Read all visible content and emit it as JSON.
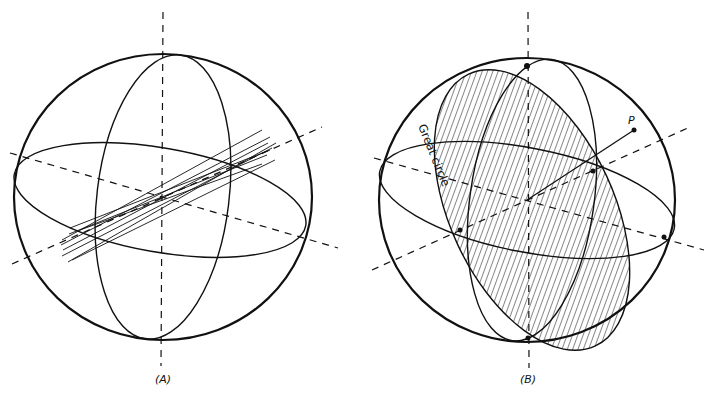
{
  "figure": {
    "panels": [
      {
        "id": "A",
        "caption": "(A)",
        "description": "Sphere with three orthogonal great circles, dashed axes, and a bundle of rays through the center"
      },
      {
        "id": "B",
        "caption": "(B)",
        "description": "Sphere with hatched great-circle plane, point P and its normal",
        "annotations": {
          "great_circle_label": "Great circle",
          "point_label": "P"
        }
      }
    ],
    "colors": {
      "stroke": "#111111",
      "background": "#ffffff"
    }
  }
}
